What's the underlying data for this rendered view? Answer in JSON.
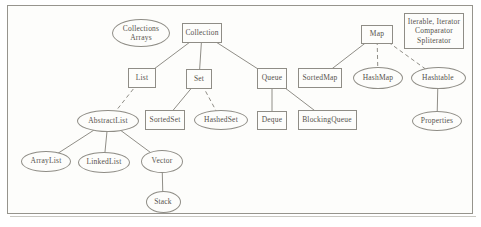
{
  "diagram": {
    "colors": {
      "background": "#fdfdfb",
      "frame_border": "#96948d",
      "node_border": "#8f8d86",
      "edge": "#908e87",
      "text": "#55514b"
    },
    "nodes": [
      {
        "id": "collections-arrays",
        "label": "Collections\nArrays",
        "shape": "ellipse",
        "cx": 141,
        "cy": 33,
        "w": 58,
        "h": 28
      },
      {
        "id": "collection",
        "label": "Collection",
        "shape": "rect",
        "cx": 202,
        "cy": 33,
        "w": 40,
        "h": 20
      },
      {
        "id": "map",
        "label": "Map",
        "shape": "rect",
        "cx": 377,
        "cy": 34,
        "w": 32,
        "h": 19
      },
      {
        "id": "iterable-group",
        "label": "Iterable, Iterator\nComparator\nSpliterator",
        "shape": "rect",
        "cx": 434,
        "cy": 31,
        "w": 60,
        "h": 36
      },
      {
        "id": "list",
        "label": "List",
        "shape": "rect",
        "cx": 142,
        "cy": 78,
        "w": 28,
        "h": 20
      },
      {
        "id": "set",
        "label": "Set",
        "shape": "rect",
        "cx": 199,
        "cy": 79,
        "w": 26,
        "h": 20
      },
      {
        "id": "queue",
        "label": "Queue",
        "shape": "rect",
        "cx": 272,
        "cy": 78,
        "w": 30,
        "h": 21
      },
      {
        "id": "sortedmap",
        "label": "SortedMap",
        "shape": "rect",
        "cx": 320,
        "cy": 78,
        "w": 44,
        "h": 20
      },
      {
        "id": "hashmap",
        "label": "HashMap",
        "shape": "ellipse",
        "cx": 378,
        "cy": 78,
        "w": 50,
        "h": 22
      },
      {
        "id": "hashtable",
        "label": "Hashtable",
        "shape": "ellipse",
        "cx": 438,
        "cy": 78,
        "w": 55,
        "h": 22
      },
      {
        "id": "abstractlist",
        "label": "AbstractList",
        "shape": "ellipse",
        "cx": 108,
        "cy": 121,
        "w": 62,
        "h": 22
      },
      {
        "id": "sortedset",
        "label": "SortedSet",
        "shape": "rect",
        "cx": 165,
        "cy": 120,
        "w": 40,
        "h": 20
      },
      {
        "id": "hashedset",
        "label": "HashedSet",
        "shape": "ellipse",
        "cx": 221,
        "cy": 120,
        "w": 54,
        "h": 20
      },
      {
        "id": "deque",
        "label": "Deque",
        "shape": "rect",
        "cx": 272,
        "cy": 120,
        "w": 30,
        "h": 19
      },
      {
        "id": "blockingqueue",
        "label": "BlockingQueue",
        "shape": "rect",
        "cx": 327,
        "cy": 120,
        "w": 59,
        "h": 20
      },
      {
        "id": "properties",
        "label": "Properties",
        "shape": "ellipse",
        "cx": 437,
        "cy": 121,
        "w": 50,
        "h": 20
      },
      {
        "id": "arraylist",
        "label": "ArrayList",
        "shape": "ellipse",
        "cx": 46,
        "cy": 161,
        "w": 50,
        "h": 21
      },
      {
        "id": "linkedlist",
        "label": "LinkedList",
        "shape": "ellipse",
        "cx": 104,
        "cy": 162,
        "w": 52,
        "h": 21
      },
      {
        "id": "vector",
        "label": "Vector",
        "shape": "ellipse",
        "cx": 162,
        "cy": 161,
        "w": 42,
        "h": 23
      },
      {
        "id": "stack",
        "label": "Stack",
        "shape": "ellipse",
        "cx": 163,
        "cy": 202,
        "w": 35,
        "h": 22
      }
    ],
    "edges": [
      {
        "from": "collection",
        "to": "list",
        "style": "solid"
      },
      {
        "from": "collection",
        "to": "set",
        "style": "solid"
      },
      {
        "from": "collection",
        "to": "queue",
        "style": "solid"
      },
      {
        "from": "map",
        "to": "sortedmap",
        "style": "solid"
      },
      {
        "from": "map",
        "to": "hashmap",
        "style": "dashed"
      },
      {
        "from": "map",
        "to": "hashtable",
        "style": "dashed"
      },
      {
        "from": "list",
        "to": "abstractlist",
        "style": "dashed"
      },
      {
        "from": "set",
        "to": "sortedset",
        "style": "solid"
      },
      {
        "from": "set",
        "to": "hashedset",
        "style": "dashed"
      },
      {
        "from": "queue",
        "to": "deque",
        "style": "solid"
      },
      {
        "from": "queue",
        "to": "blockingqueue",
        "style": "solid"
      },
      {
        "from": "abstractlist",
        "to": "arraylist",
        "style": "solid"
      },
      {
        "from": "abstractlist",
        "to": "linkedlist",
        "style": "solid"
      },
      {
        "from": "abstractlist",
        "to": "vector",
        "style": "solid"
      },
      {
        "from": "vector",
        "to": "stack",
        "style": "solid"
      },
      {
        "from": "hashtable",
        "to": "properties",
        "style": "solid"
      }
    ]
  }
}
